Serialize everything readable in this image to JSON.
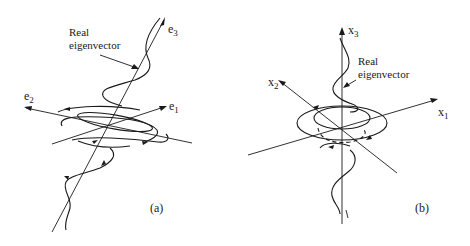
{
  "panels": [
    {
      "id": "a",
      "caption": "(a)",
      "annotation_line1": "Real",
      "annotation_line2": "eigenvector",
      "axes": [
        {
          "name": "e",
          "sub": "3"
        },
        {
          "name": "e",
          "sub": "2"
        },
        {
          "name": "e",
          "sub": "1"
        }
      ]
    },
    {
      "id": "b",
      "caption": "(b)",
      "annotation_line1": "Real",
      "annotation_line2": "eigenvector",
      "axes": [
        {
          "name": "x",
          "sub": "3"
        },
        {
          "name": "x",
          "sub": "2"
        },
        {
          "name": "x",
          "sub": "1"
        }
      ]
    }
  ]
}
